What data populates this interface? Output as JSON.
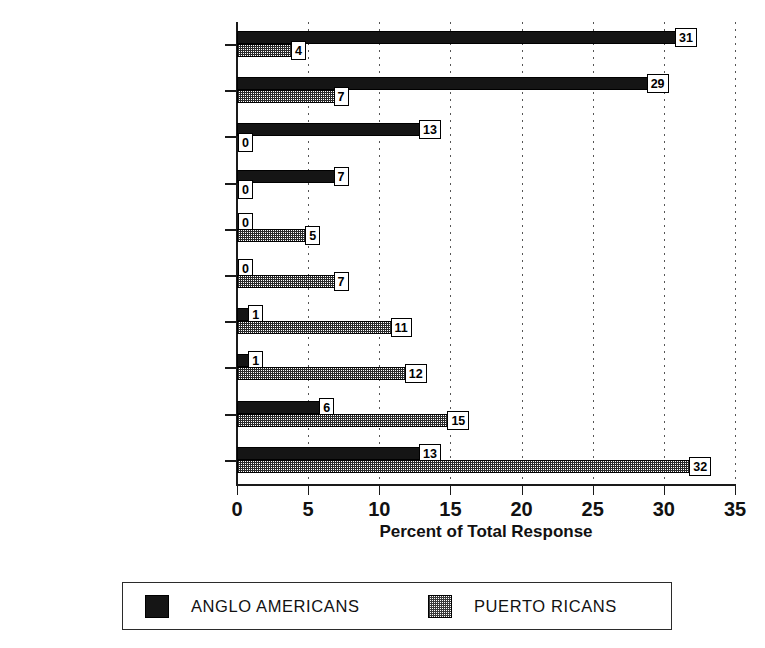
{
  "chart_data": {
    "type": "bar",
    "orientation": "horizontal",
    "title": "",
    "xlabel": "Percent of Total Response",
    "ylabel": "",
    "xlim": [
      0,
      35
    ],
    "xticks": [
      0,
      5,
      10,
      15,
      20,
      25,
      30,
      35
    ],
    "grid": "vertical-dotted",
    "legend_position": "bottom",
    "categories": [
      "POT,GRASS",
      "JOINT,SMOKE",
      "HIGH,STONED",
      "PARTY,FUN",
      "PROBLEMS",
      "YOUTH",
      "ILLNESS,DEATH",
      "BAD,VICE",
      "ILLEGAL,JAIL",
      "DRUGS,ADDICTION"
    ],
    "series": [
      {
        "name": "ANGLO AMERICANS",
        "fill": "solid-black",
        "color": "#151515",
        "values": [
          31,
          29,
          13,
          7,
          0,
          0,
          1,
          1,
          6,
          13
        ]
      },
      {
        "name": "PUERTO RICANS",
        "fill": "checkered-gray",
        "color": "#808080",
        "values": [
          4,
          7,
          0,
          0,
          5,
          7,
          11,
          12,
          15,
          32
        ]
      }
    ]
  },
  "axis": {
    "x_title": "Percent of Total Response",
    "tick_labels": [
      "0",
      "5",
      "10",
      "15",
      "20",
      "25",
      "30",
      "35"
    ]
  },
  "legend": {
    "entries": [
      {
        "label": "ANGLO AMERICANS",
        "swatch": "solid-black-swatch"
      },
      {
        "label": "PUERTO RICANS",
        "swatch": "checkered-gray-swatch"
      }
    ]
  }
}
